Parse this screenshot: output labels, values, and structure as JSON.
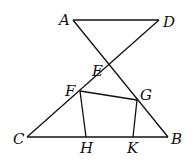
{
  "diagram": {
    "points": {
      "A": {
        "label": "A",
        "x": 73,
        "y": 20
      },
      "D": {
        "label": "D",
        "x": 159,
        "y": 20
      },
      "E": {
        "label": "E",
        "x": 109,
        "y": 65
      },
      "F": {
        "label": "F",
        "x": 80,
        "y": 91
      },
      "G": {
        "label": "G",
        "x": 137,
        "y": 100
      },
      "C": {
        "label": "C",
        "x": 27,
        "y": 137
      },
      "H": {
        "label": "H",
        "x": 86,
        "y": 137
      },
      "K": {
        "label": "K",
        "x": 133,
        "y": 137
      },
      "B": {
        "label": "B",
        "x": 168,
        "y": 137
      }
    },
    "segments": [
      "AD",
      "AB",
      "DC",
      "CB",
      "FG",
      "FH",
      "GK"
    ]
  }
}
